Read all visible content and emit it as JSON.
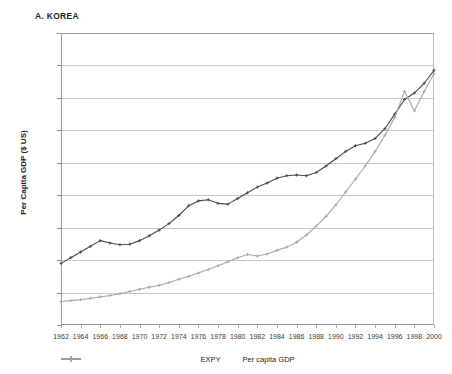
{
  "panel": {
    "title": "A. KOREA"
  },
  "axes": {
    "ylabel": "Per Capita GDP ($ US)",
    "xlabel": "",
    "yticks": [
      "0",
      "2,000",
      "4,000",
      "6,000",
      "8,000",
      "10,000",
      "12,000",
      "14,000",
      "16,000",
      "18,000"
    ],
    "xticks": [
      "1962",
      "1964",
      "1966",
      "1968",
      "1970",
      "1972",
      "1974",
      "1976",
      "1978",
      "1980",
      "1982",
      "1984",
      "1986",
      "1988",
      "1990",
      "1992",
      "1994",
      "1996",
      "1998",
      "2000"
    ]
  },
  "legend": {
    "position": "bottom-center",
    "items": [
      {
        "label": "EXPY",
        "color": "#4a4a4a",
        "marker": "cross"
      },
      {
        "label": "Per capita GDP",
        "color": "#a6a6a6",
        "marker": "cross"
      }
    ]
  },
  "colors": {
    "expy": "#4a4a4a",
    "gdp": "#a6a6a6",
    "grid": "#c8c8c8",
    "axis": "#9a9a9a",
    "text": "#231f20"
  },
  "chart_data": {
    "type": "line",
    "title": "A. KOREA",
    "xlabel": "",
    "ylabel": "Per Capita GDP ($ US)",
    "xlim": [
      1962,
      2000
    ],
    "ylim": [
      0,
      18000
    ],
    "grid": true,
    "legend_position": "bottom-center",
    "x": [
      1962,
      1963,
      1964,
      1965,
      1966,
      1967,
      1968,
      1969,
      1970,
      1971,
      1972,
      1973,
      1974,
      1975,
      1976,
      1977,
      1978,
      1979,
      1980,
      1981,
      1982,
      1983,
      1984,
      1985,
      1986,
      1987,
      1988,
      1989,
      1990,
      1991,
      1992,
      1993,
      1994,
      1995,
      1996,
      1997,
      1998,
      1999,
      2000
    ],
    "series": [
      {
        "name": "EXPY",
        "color": "#4a4a4a",
        "values": [
          3800,
          4150,
          4500,
          4850,
          5200,
          5050,
          4950,
          4980,
          5200,
          5500,
          5850,
          6250,
          6750,
          7350,
          7650,
          7720,
          7500,
          7450,
          7800,
          8150,
          8500,
          8750,
          9050,
          9200,
          9250,
          9200,
          9400,
          9800,
          10250,
          10700,
          11050,
          11200,
          11500,
          12100,
          13000,
          13900,
          14300,
          14900,
          15700
        ]
      },
      {
        "name": "Per capita GDP",
        "color": "#a6a6a6",
        "values": [
          1450,
          1500,
          1560,
          1640,
          1730,
          1820,
          1930,
          2060,
          2200,
          2330,
          2450,
          2620,
          2820,
          3000,
          3200,
          3420,
          3650,
          3900,
          4150,
          4350,
          4250,
          4380,
          4600,
          4800,
          5100,
          5550,
          6100,
          6700,
          7400,
          8200,
          9000,
          9800,
          10700,
          11700,
          12800,
          14400,
          13200,
          14400,
          15500
        ]
      }
    ]
  }
}
